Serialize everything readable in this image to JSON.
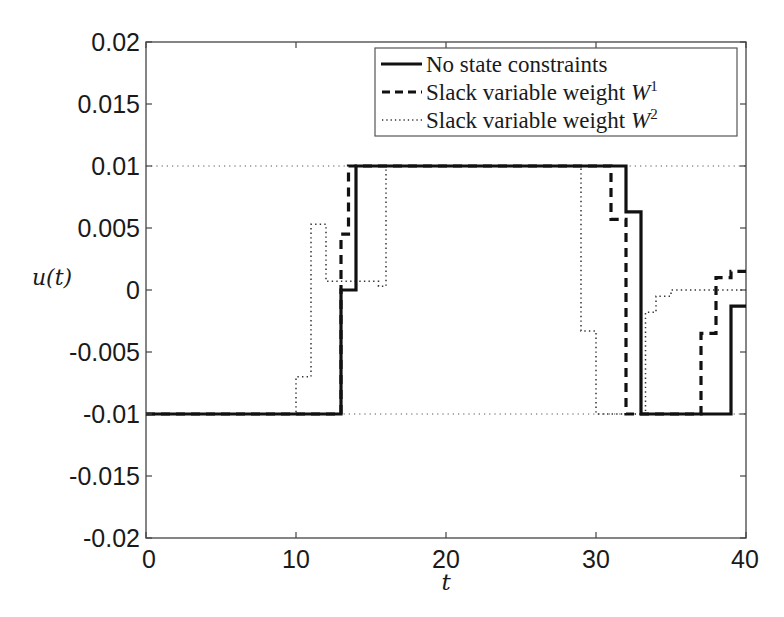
{
  "chart_data": {
    "type": "line",
    "title": "",
    "xlabel": "t",
    "ylabel": "u(t)",
    "xlim": [
      0,
      40
    ],
    "ylim": [
      -0.02,
      0.02
    ],
    "grid": false,
    "legend_position": "upper right",
    "x_ticks": [
      "0",
      "10",
      "20",
      "30",
      "40"
    ],
    "y_ticks": [
      "0.02",
      "0.015",
      "0.01",
      "0.005",
      "0",
      "-0.005",
      "-0.01",
      "-0.015",
      "-0.02"
    ],
    "reference_lines": [
      {
        "y": 0.01,
        "style": "dotted",
        "note": "upper input bound"
      },
      {
        "y": -0.01,
        "style": "dotted",
        "note": "lower input bound"
      }
    ],
    "series": [
      {
        "name": "No state constraints",
        "style": "solid",
        "step": true,
        "x": [
          0,
          13,
          13,
          14,
          14,
          32,
          32,
          33,
          33,
          39,
          39,
          40
        ],
        "y": [
          -0.01,
          -0.01,
          0,
          0,
          0.01,
          0.01,
          0.0063,
          0.0063,
          -0.01,
          -0.01,
          -0.0013,
          -0.0013
        ]
      },
      {
        "name": "Slack variable weight W^1",
        "style": "dashed",
        "step": true,
        "x": [
          0,
          13,
          13,
          13.5,
          13.5,
          31,
          31,
          32,
          32,
          37,
          37,
          38,
          38,
          39,
          39,
          40
        ],
        "y": [
          -0.01,
          -0.01,
          0.0045,
          0.0045,
          0.01,
          0.01,
          0.0057,
          0.0057,
          -0.01,
          -0.01,
          -0.0035,
          -0.0035,
          0.001,
          0.001,
          0.0015,
          0.0015
        ]
      },
      {
        "name": "Slack variable weight W^2",
        "style": "dotted",
        "step": true,
        "x": [
          0,
          10,
          10,
          11,
          11,
          12,
          12,
          15.5,
          15.5,
          16,
          16,
          29,
          29,
          30,
          30,
          33.3,
          33.3,
          34,
          34,
          35,
          35,
          40
        ],
        "y": [
          -0.01,
          -0.01,
          -0.007,
          -0.007,
          0.0053,
          0.0053,
          0.0007,
          0.0007,
          0.0003,
          0.0003,
          0.01,
          0.01,
          -0.0033,
          -0.0033,
          -0.01,
          -0.01,
          -0.0018,
          -0.0018,
          -0.0005,
          -0.0005,
          0.0,
          0.0
        ]
      }
    ]
  },
  "axes": {
    "xlabel": "t",
    "ylabel": "u(t)",
    "x_ticks": [
      "0",
      "10",
      "20",
      "30",
      "40"
    ],
    "y_ticks": [
      "0.02",
      "0.015",
      "0.01",
      "0.005",
      "0",
      "-0.005",
      "-0.01",
      "-0.015",
      "-0.02"
    ]
  },
  "legend": {
    "items": [
      {
        "label": "No state constraints",
        "style": "solid"
      },
      {
        "label": "Slack variable weight ",
        "math": "W",
        "sup": "1",
        "style": "dashed"
      },
      {
        "label": "Slack variable weight ",
        "math": "W",
        "sup": "2",
        "style": "dotted"
      }
    ]
  },
  "colors": {
    "line": "#111111",
    "axis": "#333333",
    "background": "#ffffff"
  }
}
